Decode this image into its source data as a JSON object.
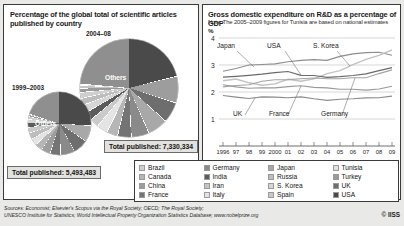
{
  "left": {
    "title": "Percentage of the global total of scientific articles published by country",
    "period_recent": "2004–08",
    "period_older": "1999–2003",
    "others_label": "Others",
    "total_recent": "Total published: 7,330,334",
    "total_older": "Total published: 5,493,483"
  },
  "right": {
    "title": "Gross domestic expenditure on R&D as a percentage of GDP",
    "note": "Note: The 2005–2009 figures for Tunisia are based on national estimates",
    "percent_symbol": "%"
  },
  "legend": [
    {
      "label": "Brazil",
      "color": "#cfcfcf"
    },
    {
      "label": "Canada",
      "color": "#b6b6b6"
    },
    {
      "label": "China",
      "color": "#9d9d9d"
    },
    {
      "label": "France",
      "color": "#747474"
    },
    {
      "label": "Germany",
      "color": "#8a8a8a"
    },
    {
      "label": "India",
      "color": "#5c5c5c"
    },
    {
      "label": "Iran",
      "color": "#c4c4c4"
    },
    {
      "label": "Italy",
      "color": "#e4e4e4"
    },
    {
      "label": "Japan",
      "color": "#a8a8a8"
    },
    {
      "label": "Russia",
      "color": "#bdbdbd"
    },
    {
      "label": "S. Korea",
      "color": "#d6d6d6"
    },
    {
      "label": "Spain",
      "color": "#cacaca"
    },
    {
      "label": "Tunisia",
      "color": "#e0e0e0"
    },
    {
      "label": "Turkey",
      "color": "#9a9a9a"
    },
    {
      "label": "UK",
      "color": "#6e6e6e"
    },
    {
      "label": "USA",
      "color": "#4a4a4a"
    }
  ],
  "sources": [
    "Sources: Economist; Elsevier's Scopus via the Royal Society; OECD; The Royal Society;",
    "UNESCO Institute for Statistics; World Intellectual Property Organization Statistics Database; www.nobelprize.org"
  ],
  "copyright": "© IISS",
  "chart_data": [
    {
      "type": "pie",
      "title": "Percentage of the global total of scientific articles published by country",
      "subtitle": "2004–08",
      "annotation": "Total published: 7,330,334",
      "categories": [
        "Others",
        "USA",
        "China",
        "UK",
        "Japan",
        "Germany",
        "France",
        "Canada",
        "Italy",
        "Spain",
        "India",
        "S. Korea",
        "Russia",
        "Brazil",
        "Turkey",
        "Iran",
        "Tunisia"
      ],
      "values": [
        38.0,
        21.0,
        8.5,
        6.5,
        6.4,
        5.6,
        4.2,
        3.4,
        3.3,
        2.7,
        2.5,
        2.3,
        2.0,
        1.7,
        1.1,
        0.6,
        0.2
      ]
    },
    {
      "type": "pie",
      "title": "Percentage of the global total of scientific articles published by country",
      "subtitle": "1999–2003",
      "annotation": "Total published: 5,493,483",
      "categories": [
        "Others",
        "USA",
        "Japan",
        "UK",
        "Germany",
        "France",
        "China",
        "Canada",
        "Italy",
        "Russia",
        "Spain",
        "India",
        "S. Korea",
        "Brazil",
        "Turkey",
        "Iran",
        "Tunisia"
      ],
      "values": [
        34.0,
        26.0,
        8.0,
        7.4,
        7.0,
        5.2,
        4.4,
        3.6,
        3.2,
        3.0,
        2.6,
        1.9,
        1.7,
        1.1,
        0.6,
        0.2,
        0.1
      ]
    },
    {
      "type": "line",
      "title": "Gross domestic expenditure on R&D as a percentage of GDP",
      "note": "Note: The 2005–2009 figures for Tunisia are based on national estimates",
      "ylabel": "%",
      "ylim": [
        0,
        4
      ],
      "yticks": [
        1,
        2,
        3,
        4
      ],
      "grid": true,
      "x": [
        "1996",
        "97",
        "98",
        "99",
        "2000",
        "01",
        "02",
        "03",
        "04",
        "05",
        "06",
        "07",
        "08",
        "09"
      ],
      "xlabels": [
        "1996",
        "97",
        "98",
        "99",
        "2000",
        "01",
        "02",
        "03",
        "04",
        "05",
        "06",
        "07",
        "08",
        "09"
      ],
      "annotations": [
        "Japan",
        "USA",
        "S. Korea",
        "UK",
        "France",
        "Germany"
      ],
      "series": [
        {
          "name": "Japan",
          "values": [
            2.77,
            2.87,
            3.0,
            3.02,
            3.04,
            3.12,
            3.17,
            3.2,
            3.17,
            3.32,
            3.41,
            3.46,
            3.47,
            3.36
          ]
        },
        {
          "name": "S. Korea",
          "values": [
            2.42,
            2.48,
            2.34,
            2.25,
            2.3,
            2.47,
            2.4,
            2.49,
            2.68,
            2.79,
            3.01,
            3.21,
            3.36,
            3.56
          ]
        },
        {
          "name": "USA",
          "values": [
            2.55,
            2.58,
            2.62,
            2.66,
            2.72,
            2.76,
            2.62,
            2.61,
            2.54,
            2.57,
            2.61,
            2.67,
            2.79,
            2.9
          ]
        },
        {
          "name": "Germany",
          "values": [
            2.19,
            2.24,
            2.27,
            2.4,
            2.45,
            2.46,
            2.49,
            2.52,
            2.49,
            2.49,
            2.53,
            2.53,
            2.68,
            2.82
          ]
        },
        {
          "name": "France",
          "values": [
            2.27,
            2.19,
            2.14,
            2.16,
            2.15,
            2.2,
            2.23,
            2.17,
            2.15,
            2.1,
            2.1,
            2.07,
            2.11,
            2.21
          ]
        },
        {
          "name": "UK",
          "values": [
            1.87,
            1.81,
            1.76,
            1.82,
            1.81,
            1.79,
            1.82,
            1.75,
            1.69,
            1.73,
            1.75,
            1.78,
            1.79,
            1.85
          ]
        }
      ]
    }
  ]
}
